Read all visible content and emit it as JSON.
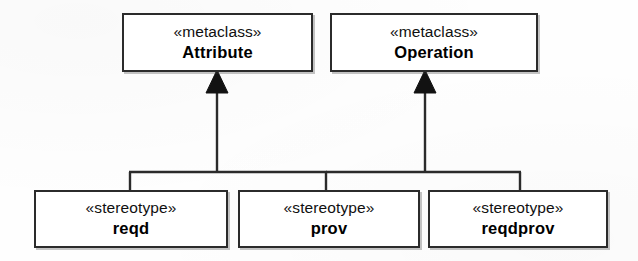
{
  "diagram": {
    "type": "uml-class-diagram",
    "relationship": "generalization",
    "arrowhead": "filled-triangle",
    "line_color": "#2b2b2b",
    "box_fill": "#ffffff",
    "box_border": "#2b2b2b",
    "background": "#fefefe"
  },
  "metaclasses": [
    {
      "id": "attribute",
      "keyword": "«metaclass»",
      "name": "Attribute",
      "x": 122,
      "y": 13,
      "w": 191,
      "h": 59
    },
    {
      "id": "operation",
      "keyword": "«metaclass»",
      "name": "Operation",
      "x": 330,
      "y": 13,
      "w": 208,
      "h": 59
    }
  ],
  "stereotypes": [
    {
      "id": "reqd",
      "keyword": "«stereotype»",
      "name": "reqd",
      "x": 34,
      "y": 190,
      "w": 194,
      "h": 58
    },
    {
      "id": "prov",
      "keyword": "«stereotype»",
      "name": "prov",
      "x": 238,
      "y": 190,
      "w": 182,
      "h": 58
    },
    {
      "id": "reqdprov",
      "keyword": "«stereotype»",
      "name": "reqdprov",
      "x": 428,
      "y": 190,
      "w": 180,
      "h": 58
    }
  ],
  "connections": [
    {
      "from": "reqd",
      "to": "attribute"
    },
    {
      "from": "prov",
      "to": "attribute"
    },
    {
      "from": "prov",
      "to": "operation"
    },
    {
      "from": "reqdprov",
      "to": "operation"
    }
  ]
}
